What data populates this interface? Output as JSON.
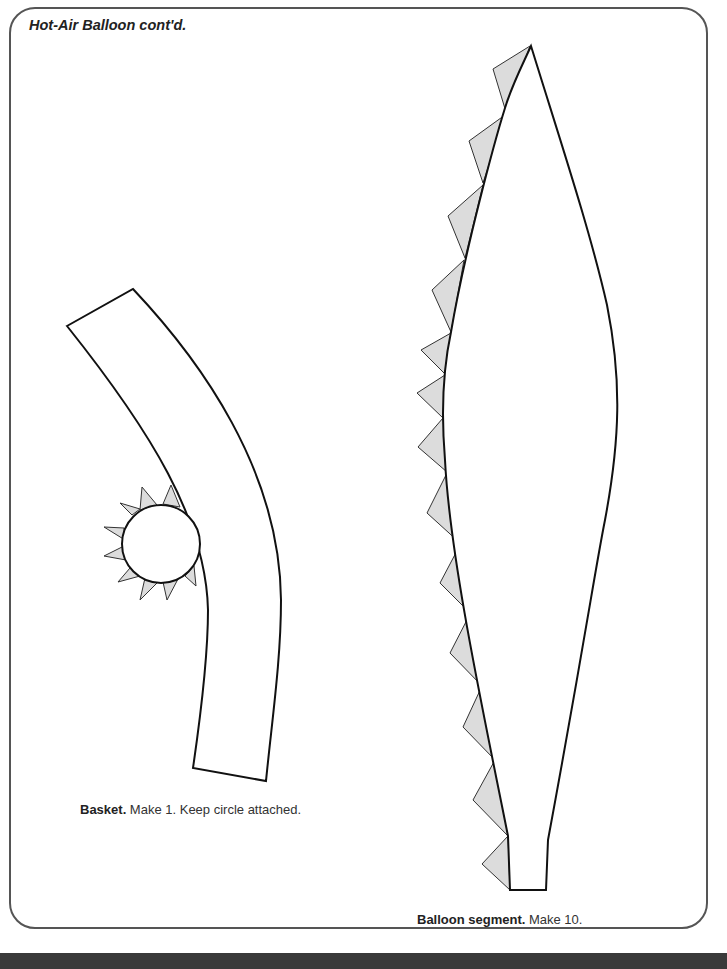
{
  "page": {
    "title": "Hot-Air Balloon cont'd.",
    "colors": {
      "frame": "#555555",
      "outline": "#111111",
      "tab_fill": "#dcdcdc",
      "bottom_bar": "#3a3a3a"
    }
  },
  "basket": {
    "caption_bold": "Basket.",
    "caption_text": " Make 1. Keep circle attached.",
    "quantity": 1
  },
  "balloon_segment": {
    "caption_bold": "Balloon segment.",
    "caption_text": " Make 10.",
    "quantity": 10,
    "glue_tabs": 14
  }
}
